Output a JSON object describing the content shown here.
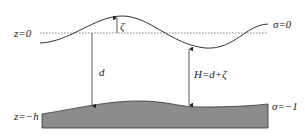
{
  "diagram": {
    "labels": {
      "z_surface": "z=0",
      "z_bottom": "z=−h",
      "sigma_top": "σ=0",
      "sigma_bottom": "σ=−1",
      "zeta": "ζ",
      "d": "d",
      "H": "H=d+ζ"
    },
    "colors": {
      "line": "#333333",
      "bed_fill": "#8c8c8c",
      "dashed": "#666666"
    }
  }
}
